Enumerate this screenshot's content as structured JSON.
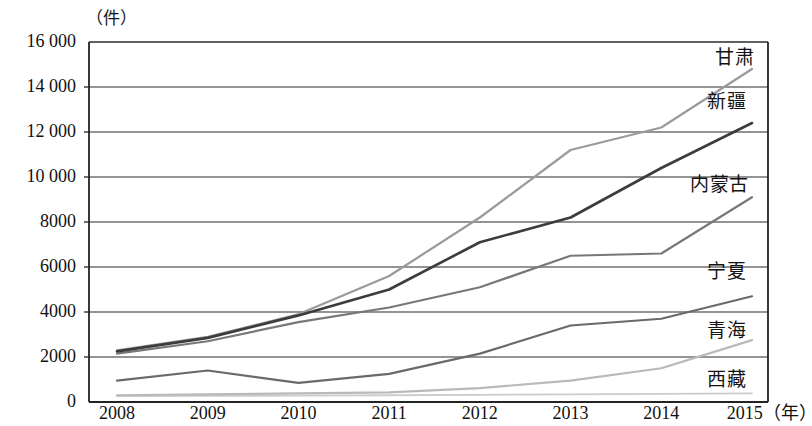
{
  "chart_data": {
    "type": "line",
    "title": "",
    "unit_label": "（件）",
    "xlabel": "（年）",
    "ylabel": "",
    "categories": [
      "2008",
      "2009",
      "2010",
      "2011",
      "2012",
      "2013",
      "2014",
      "2015"
    ],
    "x_tick_labels": [
      "2008",
      "2009",
      "2010",
      "2011",
      "2012",
      "2013",
      "2014",
      "2015（年）"
    ],
    "y_tick_labels": [
      "0",
      "2000",
      "4000",
      "6000",
      "8000",
      "10 000",
      "12 000",
      "14 000",
      "16 000"
    ],
    "y_tick_values": [
      0,
      2000,
      4000,
      6000,
      8000,
      10000,
      12000,
      14000,
      16000
    ],
    "ylim": [
      0,
      16000
    ],
    "grid": true,
    "legend_position": "right-inline",
    "series": [
      {
        "name": "甘肃",
        "color": "#9a9a9a",
        "values": [
          2300,
          2900,
          3900,
          5600,
          8200,
          11200,
          12200,
          14800
        ]
      },
      {
        "name": "新疆",
        "color": "#3c3c3c",
        "values": [
          2250,
          2850,
          3850,
          5000,
          7100,
          8200,
          10400,
          12400
        ]
      },
      {
        "name": "内蒙古",
        "color": "#787878",
        "values": [
          2150,
          2700,
          3550,
          4200,
          5100,
          6500,
          6600,
          9100
        ]
      },
      {
        "name": "宁夏",
        "color": "#6a6a6a",
        "values": [
          950,
          1400,
          850,
          1250,
          2150,
          3400,
          3700,
          4700
        ]
      },
      {
        "name": "青海",
        "color": "#b9b9b9",
        "values": [
          300,
          340,
          380,
          430,
          620,
          950,
          1500,
          2750
        ]
      },
      {
        "name": "西藏",
        "color": "#cccccc",
        "values": [
          260,
          270,
          280,
          300,
          320,
          340,
          360,
          380
        ]
      }
    ],
    "series_labels": [
      {
        "name": "甘肃",
        "x": 715,
        "y": 48
      },
      {
        "name": "新疆",
        "x": 707,
        "y": 92
      },
      {
        "name": "内蒙古",
        "x": 690,
        "y": 175
      },
      {
        "name": "宁夏",
        "x": 707,
        "y": 262
      },
      {
        "name": "青海",
        "x": 707,
        "y": 321
      },
      {
        "name": "西藏",
        "x": 707,
        "y": 370
      }
    ]
  }
}
